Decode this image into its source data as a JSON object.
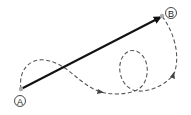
{
  "diagram": {
    "type": "displacement-vs-path",
    "points": {
      "A": {
        "label": "A",
        "x": 21,
        "y": 89
      },
      "B": {
        "label": "B",
        "x": 162,
        "y": 16
      }
    },
    "colors": {
      "displacement_arrow": "#111111",
      "path_dashed": "#555555",
      "point_dot": "#aaaaaa",
      "label_circle": "#333333"
    }
  }
}
